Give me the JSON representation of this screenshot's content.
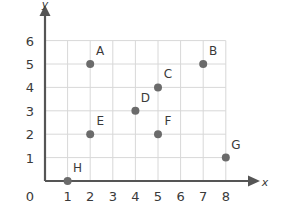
{
  "chart_data": {
    "type": "scatter",
    "title": "",
    "xlabel": "x",
    "ylabel": "y",
    "xlim": [
      0,
      8
    ],
    "ylim": [
      0,
      6
    ],
    "grid": true,
    "legend": "none",
    "x_ticks": [
      "1",
      "2",
      "3",
      "4",
      "5",
      "6",
      "7",
      "8"
    ],
    "y_ticks": [
      "1",
      "2",
      "3",
      "4",
      "5",
      "6"
    ],
    "origin_label": "0",
    "point_color": "#6b6b6b",
    "axis_color": "#555555",
    "grid_color": "#d8d8d8",
    "text_color": "#3a3a3a",
    "points": [
      {
        "label": "A",
        "x": 2,
        "y": 5
      },
      {
        "label": "B",
        "x": 7,
        "y": 5
      },
      {
        "label": "C",
        "x": 5,
        "y": 4
      },
      {
        "label": "D",
        "x": 4,
        "y": 3
      },
      {
        "label": "E",
        "x": 2,
        "y": 2
      },
      {
        "label": "F",
        "x": 5,
        "y": 2
      },
      {
        "label": "G",
        "x": 8,
        "y": 1
      },
      {
        "label": "H",
        "x": 1,
        "y": 0
      }
    ]
  }
}
